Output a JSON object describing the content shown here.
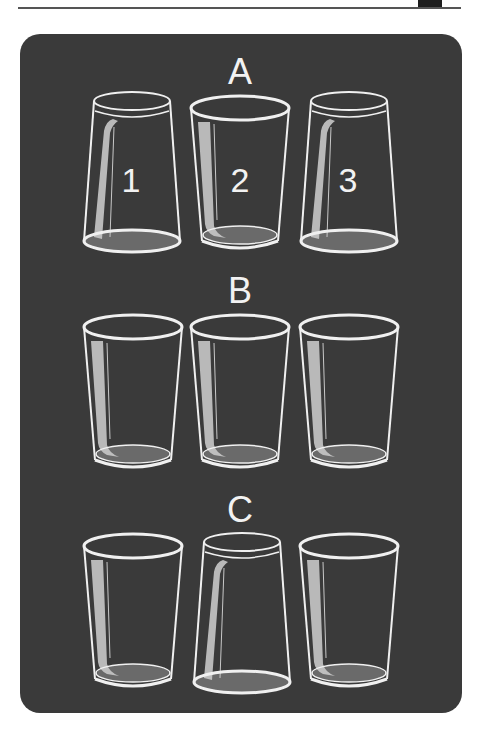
{
  "diagram": {
    "colors": {
      "background": "#ffffff",
      "card": "#3a3a3a",
      "outline": "#f0f0f0",
      "base_fill": "#6a6a6a",
      "highlight": "#c8c8c8"
    },
    "rows": [
      {
        "label": "A",
        "glasses": [
          {
            "number": "1",
            "orientation": "upside-down"
          },
          {
            "number": "2",
            "orientation": "upright"
          },
          {
            "number": "3",
            "orientation": "upside-down"
          }
        ]
      },
      {
        "label": "B",
        "glasses": [
          {
            "number": "",
            "orientation": "upright"
          },
          {
            "number": "",
            "orientation": "upright"
          },
          {
            "number": "",
            "orientation": "upright"
          }
        ]
      },
      {
        "label": "C",
        "glasses": [
          {
            "number": "",
            "orientation": "upright"
          },
          {
            "number": "",
            "orientation": "upside-down"
          },
          {
            "number": "",
            "orientation": "upright"
          }
        ]
      }
    ]
  }
}
